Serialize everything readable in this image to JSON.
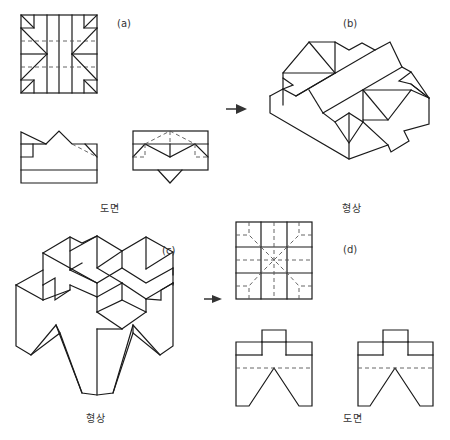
{
  "figures": {
    "a": {
      "label": "(a)",
      "caption": "도면"
    },
    "b": {
      "label": "(b)",
      "caption": "형상"
    },
    "c": {
      "label": "(c)",
      "caption": "형상"
    },
    "d": {
      "label": "(d)",
      "caption": "도면"
    }
  },
  "arrows": [
    {
      "from": "a",
      "to": "b",
      "icon": "arrow-right-icon"
    },
    {
      "from": "c",
      "to": "d",
      "icon": "arrow-right-icon"
    }
  ],
  "colors": {
    "line": "#1a1a1a",
    "hidden_line": "#555555",
    "background": "#ffffff"
  }
}
